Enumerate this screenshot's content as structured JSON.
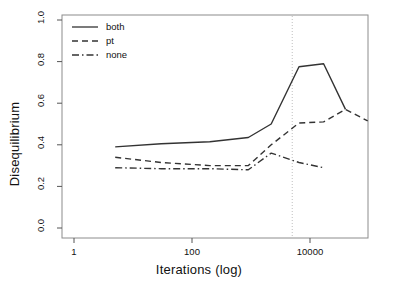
{
  "chart_data": {
    "type": "line",
    "title": "",
    "xlabel": "Iterations (log)",
    "ylabel": "Disequilibrium",
    "xscale": "log",
    "xlim": [
      1,
      100000
    ],
    "ylim": [
      0.0,
      1.0
    ],
    "xticks": [
      1,
      100,
      10000
    ],
    "xtick_labels": [
      "1",
      "100",
      "10000"
    ],
    "yticks": [
      0.0,
      0.2,
      0.4,
      0.6,
      0.8,
      1.0
    ],
    "ytick_labels": [
      "0.0",
      "0.2",
      "0.4",
      "0.6",
      "0.8",
      "1.0"
    ],
    "grid": false,
    "legend_position": "top-left",
    "annotations": [
      {
        "name": "threshold-line",
        "type": "vline",
        "x": 5000,
        "style": "dotted",
        "color": "#bfbfbf"
      }
    ],
    "series": [
      {
        "name": "both",
        "style": "solid",
        "color": "#333333",
        "x": [
          5.0,
          30.0,
          200.0,
          900.0,
          2200.0,
          6500.0,
          17000.0,
          40000.0
        ],
        "y": [
          0.39,
          0.405,
          0.415,
          0.435,
          0.5,
          0.775,
          0.79,
          0.57
        ]
      },
      {
        "name": "pt",
        "style": "dashed",
        "color": "#333333",
        "x": [
          5.0,
          30.0,
          200.0,
          900.0,
          2200.0,
          6500.0,
          17000.0,
          40000.0,
          95000.0
        ],
        "y": [
          0.34,
          0.315,
          0.3,
          0.3,
          0.4,
          0.505,
          0.51,
          0.57,
          0.515
        ]
      },
      {
        "name": "none",
        "style": "dashdot",
        "color": "#333333",
        "x": [
          5.0,
          30.0,
          200.0,
          900.0,
          2200.0,
          6500.0,
          17000.0
        ],
        "y": [
          0.29,
          0.285,
          0.285,
          0.28,
          0.36,
          0.315,
          0.29
        ]
      }
    ]
  },
  "legend": {
    "entries": [
      {
        "label": "both",
        "style": "solid"
      },
      {
        "label": "pt",
        "style": "dashed"
      },
      {
        "label": "none",
        "style": "dashdot"
      }
    ]
  },
  "axes": {
    "x_title": "Iterations (log)",
    "y_title": "Disequilibrium"
  }
}
